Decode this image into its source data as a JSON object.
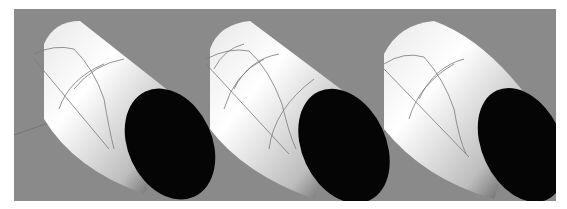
{
  "figure": {
    "background_color": "#ffffff",
    "panel_color": "#8a8a8a",
    "views": [
      {
        "name": "cylinder-view-1",
        "isocurves": "few"
      },
      {
        "name": "cylinder-view-2",
        "isocurves": "more"
      },
      {
        "name": "cylinder-view-3",
        "isocurves": "few-rounded"
      }
    ],
    "colors": {
      "end_cap": "#050505",
      "isocurve": "#7a7a7a",
      "grid_line": "#6e6e6e"
    }
  }
}
